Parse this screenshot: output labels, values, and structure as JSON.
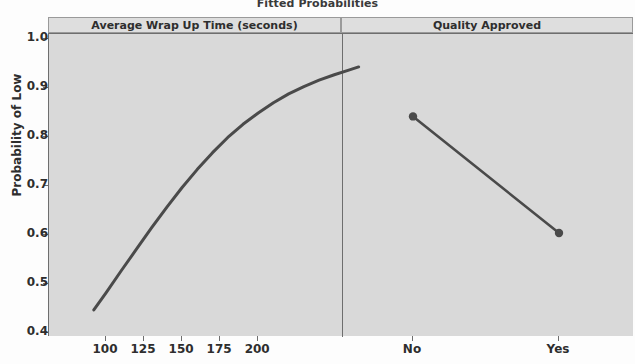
{
  "chart_data": {
    "type": "line",
    "title": "Fitted Probabilities",
    "ylabel": "Probability of Low",
    "xlabel": "",
    "ylim": [
      0.4,
      1.0
    ],
    "y_ticks": [
      "1.0",
      "0.9",
      "0.8",
      "0.7",
      "0.6",
      "0.5",
      "0.4"
    ],
    "y_tick_values": [
      1.0,
      0.9,
      0.8,
      0.7,
      0.6,
      0.5,
      0.4
    ],
    "grid": false,
    "legend": "none",
    "panels": [
      {
        "name": "panel-wrap-up-time",
        "header": "Average Wrap Up Time (seconds)",
        "type": "line",
        "xlim": [
          92,
          266
        ],
        "x_ticks": [
          "100",
          "125",
          "150",
          "175",
          "200"
        ],
        "x_tick_values": [
          100,
          125,
          150,
          175,
          200
        ],
        "series": [
          {
            "name": "Fitted probability of Low",
            "x": [
              92,
              100,
              110,
              120,
              130,
              140,
              150,
              160,
              170,
              180,
              190,
              200,
              210,
              220,
              230,
              240,
              250,
              260,
              266
            ],
            "values": [
              0.447,
              0.482,
              0.527,
              0.571,
              0.615,
              0.657,
              0.697,
              0.734,
              0.768,
              0.799,
              0.826,
              0.849,
              0.87,
              0.888,
              0.903,
              0.916,
              0.927,
              0.937,
              0.943
            ],
            "markers": false
          }
        ]
      },
      {
        "name": "panel-quality-approved",
        "header": "Quality Approved",
        "type": "line",
        "categories": [
          "No",
          "Yes"
        ],
        "series": [
          {
            "name": "Fitted probability of Low",
            "values": [
              0.842,
              0.604
            ],
            "markers": true
          }
        ]
      }
    ]
  },
  "style": {
    "line_color": "#4a4a4a",
    "panel_fill": "#d9d9d9",
    "strip_fill": "#dedede",
    "axis_color": "#6e6e6e",
    "text_color": "#2e2e2e"
  }
}
